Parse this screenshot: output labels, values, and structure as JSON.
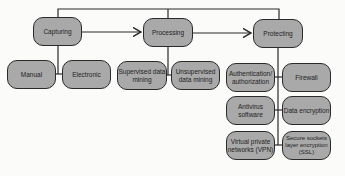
{
  "diagram": {
    "colors": {
      "node_fill": "#a9a9a9",
      "border": "#2a2a2a",
      "background": "#fbfbfa"
    },
    "stages": [
      {
        "id": "capturing",
        "label": "Capturing",
        "children": [
          "Manual",
          "Electronic"
        ]
      },
      {
        "id": "processing",
        "label": "Processing",
        "children": [
          "Supervised data mining",
          "Unsupervised data mining"
        ]
      },
      {
        "id": "protecting",
        "label": "Protecting",
        "children": [
          "Authentication/ authorization",
          "Firewall",
          "Antivirus software",
          "Data encryption",
          "Virtual private networks (VPN)",
          "Secure sockets layer encryption (SSL)"
        ]
      }
    ],
    "nodes": {
      "capturing": "Capturing",
      "processing": "Processing",
      "protecting": "Protecting",
      "manual": "Manual",
      "electronic": "Electronic",
      "supervised": "Supervised data mining",
      "unsupervised": "Unsupervised data mining",
      "auth": "Authentication/ authorization",
      "firewall": "Firewall",
      "antivirus": "Antivirus software",
      "encryption": "Data encryption",
      "vpn": "Virtual private networks (VPN)",
      "ssl": "Secure sockets layer encryption (SSL)"
    },
    "edges": [
      [
        "capturing",
        "processing"
      ],
      [
        "processing",
        "protecting"
      ],
      [
        "capturing",
        "protecting"
      ],
      [
        "capturing",
        "manual"
      ],
      [
        "capturing",
        "electronic"
      ],
      [
        "processing",
        "supervised"
      ],
      [
        "processing",
        "unsupervised"
      ],
      [
        "protecting",
        "auth"
      ],
      [
        "protecting",
        "firewall"
      ],
      [
        "protecting",
        "antivirus"
      ],
      [
        "protecting",
        "encryption"
      ],
      [
        "protecting",
        "vpn"
      ],
      [
        "protecting",
        "ssl"
      ]
    ]
  }
}
